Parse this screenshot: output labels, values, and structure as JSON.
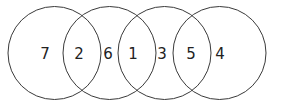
{
  "diagram": {
    "type": "venn-chain",
    "circles": [
      {
        "id": "c1",
        "cx": 54.5,
        "cy": 53,
        "r": 46.5
      },
      {
        "id": "c2",
        "cx": 109.5,
        "cy": 53,
        "r": 46.5
      },
      {
        "id": "c3",
        "cx": 164.5,
        "cy": 53,
        "r": 46.5
      },
      {
        "id": "c4",
        "cx": 219.5,
        "cy": 53,
        "r": 46.5
      }
    ],
    "regions": [
      {
        "label": "7",
        "position": "circle-1-only",
        "x": 45,
        "y": 59
      },
      {
        "label": "2",
        "position": "circle-1-and-2",
        "x": 79,
        "y": 59
      },
      {
        "label": "6",
        "position": "circle-2-only",
        "x": 108,
        "y": 59
      },
      {
        "label": "1",
        "position": "circle-2-and-3",
        "x": 133,
        "y": 59
      },
      {
        "label": "3",
        "position": "circle-3-only",
        "x": 162,
        "y": 59
      },
      {
        "label": "5",
        "position": "circle-3-and-4",
        "x": 191,
        "y": 59
      },
      {
        "label": "4",
        "position": "circle-4-only",
        "x": 220,
        "y": 59
      }
    ],
    "colors": {
      "stroke": "#3a3a3a",
      "text": "#222222",
      "background": "#ffffff"
    }
  }
}
